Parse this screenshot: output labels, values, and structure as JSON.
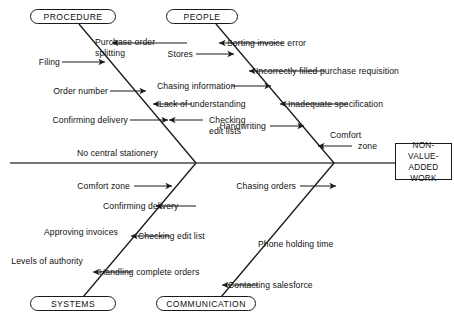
{
  "diagram": {
    "type": "fishbone-ishikawa",
    "effect": {
      "line1": "NON-VALUE-",
      "line2": "ADDED WORK",
      "full": "NON-VALUE-ADDED WORK"
    },
    "categories": [
      {
        "id": "procedure",
        "label": "PROCEDURE",
        "position": "top-left"
      },
      {
        "id": "people",
        "label": "PEOPLE",
        "position": "top-right"
      },
      {
        "id": "systems",
        "label": "SYSTEMS",
        "position": "bottom-left"
      },
      {
        "id": "communication",
        "label": "COMMUNICATION",
        "position": "bottom-right"
      }
    ],
    "causes": {
      "procedure": [
        {
          "text": "Purchase order splitting",
          "line1": "Purchase order",
          "line2": "splitting",
          "arrow": "left"
        },
        {
          "text": "Filing",
          "line1": "Filing",
          "line2": "",
          "arrow": "right"
        },
        {
          "text": "Order number",
          "line1": "Order number",
          "line2": "",
          "arrow": "right"
        },
        {
          "text": "Lack of understanding",
          "line1": "Lack of understanding",
          "line2": "",
          "arrow": "left"
        },
        {
          "text": "Confirming delivery",
          "line1": "Confirming delivery",
          "line2": "",
          "arrow": "right"
        },
        {
          "text": "Checking edit lists",
          "line1": "Checking",
          "line2": "edit lists",
          "arrow": "left"
        },
        {
          "text": "No central stationery",
          "line1": "No central stationery",
          "line2": "",
          "arrow": "none"
        }
      ],
      "people": [
        {
          "text": "Sorting invoice error",
          "line1": "Sorting invoice error",
          "line2": "",
          "arrow": "left"
        },
        {
          "text": "Stores",
          "line1": "Stores",
          "line2": "",
          "arrow": "right"
        },
        {
          "text": "Incorrectly filled purchase requisition",
          "line1": "Incorrectly filled purchase requisition",
          "line2": "",
          "arrow": "left"
        },
        {
          "text": "Chasing information",
          "line1": "Chasing information",
          "line2": "",
          "arrow": "right"
        },
        {
          "text": "Inadequate specification",
          "line1": "Inadequate specification",
          "line2": "",
          "arrow": "left"
        },
        {
          "text": "Handwriting",
          "line1": "Handwriting",
          "line2": "",
          "arrow": "right"
        },
        {
          "text": "Comfort zone",
          "line1": "Comfort",
          "line2": "zone",
          "arrow": "left"
        }
      ],
      "systems": [
        {
          "text": "Comfort zone",
          "line1": "Comfort zone",
          "line2": "",
          "arrow": "right"
        },
        {
          "text": "Confirming delivery",
          "line1": "Confirming delivery",
          "line2": "",
          "arrow": "left"
        },
        {
          "text": "Approving invoices",
          "line1": "Approving invoices",
          "line2": "",
          "arrow": "none"
        },
        {
          "text": "Checking edit list",
          "line1": "Checking edit list",
          "line2": "",
          "arrow": "left"
        },
        {
          "text": "Levels of authority",
          "line1": "Levels of authority",
          "line2": "",
          "arrow": "none"
        },
        {
          "text": "Handling complete orders",
          "line1": "Handling complete orders",
          "line2": "",
          "arrow": "left"
        }
      ],
      "communication": [
        {
          "text": "Chasing orders",
          "line1": "Chasing orders",
          "line2": "",
          "arrow": "right"
        },
        {
          "text": "Phone holding time",
          "line1": "Phone holding time",
          "line2": "",
          "arrow": "none"
        },
        {
          "text": "Contacting salesforce",
          "line1": "Contacting salesforce",
          "line2": "",
          "arrow": "left"
        }
      ]
    },
    "colors": {
      "stroke": "#1a1a1a",
      "spine": "#4a4a4a",
      "text": "#111111",
      "background": "#ffffff"
    }
  }
}
